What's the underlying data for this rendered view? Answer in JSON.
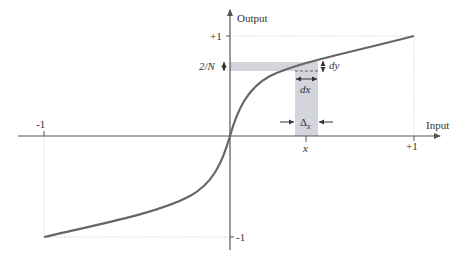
{
  "diagram": {
    "axes": {
      "x_label": "Input",
      "y_label": "Output",
      "x_ticks": [
        "-1",
        "+1"
      ],
      "y_ticks": [
        "+1",
        "-1"
      ],
      "x_marker": "x"
    },
    "annotations": {
      "step_height": "2/N",
      "dy": "dy",
      "dx": "dx",
      "delta_x_main": "Δ",
      "delta_x_sub": "x"
    },
    "colors": {
      "curve": "#666666",
      "axes": "#555555",
      "band": "#d4d4dc",
      "guide": "#c8c8c8",
      "text": "#333333"
    }
  }
}
